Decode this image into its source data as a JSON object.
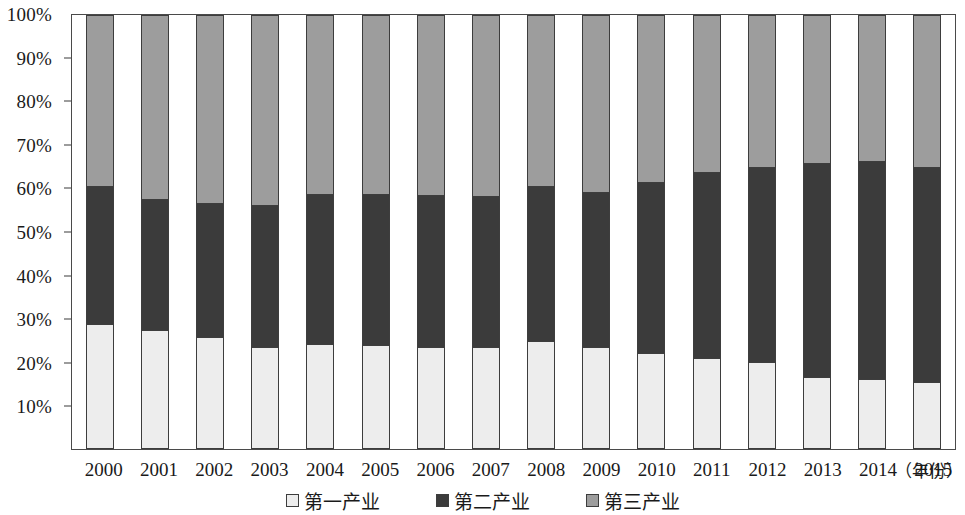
{
  "chart_data": {
    "type": "bar",
    "title": "",
    "xlabel": "（年份）",
    "ylabel": "",
    "stacked": true,
    "stacked_100_percent": true,
    "grid": false,
    "legend_position": "bottom",
    "ylim": [
      0,
      100
    ],
    "yticks": [
      "10%",
      "20%",
      "30%",
      "40%",
      "50%",
      "60%",
      "70%",
      "80%",
      "90%",
      "100%"
    ],
    "ytick_values": [
      10,
      20,
      30,
      40,
      50,
      60,
      70,
      80,
      90,
      100
    ],
    "categories": [
      "2000",
      "2001",
      "2002",
      "2003",
      "2004",
      "2005",
      "2006",
      "2007",
      "2008",
      "2009",
      "2010",
      "2011",
      "2012",
      "2013",
      "2014",
      "2015"
    ],
    "series": [
      {
        "name": "第一产业",
        "color": "#ededed",
        "values": [
          28.9,
          27.5,
          25.9,
          23.6,
          24.1,
          23.9,
          23.6,
          23.6,
          24.8,
          23.4,
          22.2,
          20.9,
          20.0,
          16.5,
          16.1,
          15.4
        ]
      },
      {
        "name": "第二产业",
        "color": "#3b3b3b",
        "values": [
          31.5,
          29.9,
          30.5,
          32.4,
          34.4,
          34.6,
          34.8,
          34.5,
          35.6,
          35.7,
          39.2,
          42.8,
          44.7,
          49.2,
          50.1,
          49.4
        ]
      },
      {
        "name": "第三产业",
        "color": "#9d9d9d",
        "values": [
          39.6,
          42.6,
          43.6,
          44.0,
          41.5,
          41.5,
          41.6,
          41.9,
          39.6,
          40.9,
          38.6,
          36.3,
          35.3,
          34.3,
          33.8,
          35.2
        ]
      }
    ],
    "cumulative_first_plus_second": [
      60.4,
      57.4,
      56.4,
      56.0,
      58.5,
      58.5,
      58.4,
      58.1,
      60.4,
      59.1,
      61.4,
      63.7,
      64.7,
      65.7,
      66.2,
      64.8
    ]
  },
  "axes": {
    "y_tick_labels": [
      "100%",
      "90%",
      "80%",
      "70%",
      "60%",
      "50%",
      "40%",
      "30%",
      "20%",
      "10%"
    ],
    "x_tick_labels": [
      "2000",
      "2001",
      "2002",
      "2003",
      "2004",
      "2005",
      "2006",
      "2007",
      "2008",
      "2009",
      "2010",
      "2011",
      "2012",
      "2013",
      "2014",
      "2015"
    ],
    "x_axis_title": "（年份）"
  },
  "legend": {
    "items": [
      {
        "label": "第一产业",
        "color": "#ededed",
        "swatch": "square-light-swatch"
      },
      {
        "label": "第二产业",
        "color": "#3b3b3b",
        "swatch": "square-dark-swatch"
      },
      {
        "label": "第三产业",
        "color": "#9d9d9d",
        "swatch": "square-gray-swatch"
      }
    ]
  },
  "colors": {
    "first_industry": "#ededed",
    "second_industry": "#3b3b3b",
    "third_industry": "#9d9d9d",
    "axis": "#4a4a4a",
    "text": "#1a1a1a",
    "background": "#ffffff"
  }
}
